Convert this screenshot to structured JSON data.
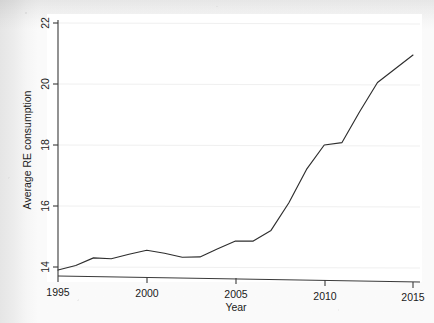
{
  "chart_data": {
    "type": "line",
    "title": "",
    "xlabel": "Year",
    "ylabel": "Average RE consumption",
    "xlim": [
      1995,
      2015
    ],
    "ylim": [
      13.6,
      22.2
    ],
    "grid": true,
    "legend": "none",
    "x_ticks": [
      "1995",
      "2000",
      "2005",
      "2010",
      "2015"
    ],
    "y_ticks": [
      "14",
      "16",
      "18",
      "20",
      "22"
    ],
    "x": [
      1995,
      1996,
      1997,
      1998,
      1999,
      2000,
      2001,
      2002,
      2003,
      2004,
      2005,
      2006,
      2007,
      2008,
      2009,
      2010,
      2011,
      2012,
      2013,
      2014,
      2015
    ],
    "series": [
      {
        "name": "Average RE consumption",
        "values": [
          13.9,
          14.05,
          14.3,
          14.27,
          14.42,
          14.55,
          14.45,
          14.32,
          14.33,
          14.6,
          14.85,
          14.85,
          15.2,
          16.1,
          17.2,
          18.0,
          18.08,
          19.1,
          20.05,
          20.5,
          20.95
        ]
      }
    ]
  },
  "axis": {
    "x_tick_values": [
      1995,
      2000,
      2005,
      2010,
      2015
    ],
    "y_tick_values": [
      14,
      16,
      18,
      20,
      22
    ]
  }
}
